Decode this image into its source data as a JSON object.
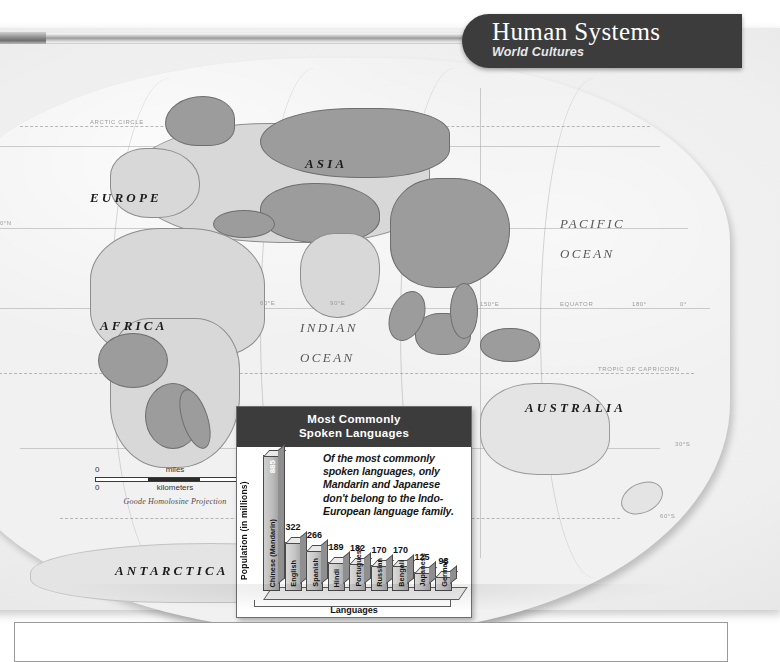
{
  "header": {
    "title": "Human Systems",
    "subtitle": "World Cultures"
  },
  "map": {
    "continents": [
      "EUROPE",
      "ASIA",
      "AFRICA",
      "AUSTRALIA",
      "ANTARCTICA"
    ],
    "oceans": [
      {
        "line1": "PACIFIC",
        "line2": "OCEAN"
      },
      {
        "line1": "INDIAN",
        "line2": "OCEAN"
      }
    ],
    "reference_lines": [
      "ARCTIC CIRCLE",
      "EQUATOR",
      "TROPIC OF CAPRICORN"
    ],
    "grid_labels": [
      "30°N",
      "60°E",
      "90°E",
      "150°E",
      "180°",
      "0°",
      "30°S",
      "60°S"
    ],
    "scale": {
      "miles_label": "miles",
      "miles_min": "0",
      "miles_max": "2000",
      "km_label": "kilometers",
      "km_min": "0",
      "km_max": "3000",
      "projection": "Goode Homolosine Projection"
    }
  },
  "chart_data": {
    "type": "bar",
    "title": "Most Commonly Spoken Languages",
    "title_line1": "Most Commonly",
    "title_line2": "Spoken Languages",
    "xlabel": "Languages",
    "ylabel": "Population (in millions)",
    "ylim": [
      0,
      885
    ],
    "grid": false,
    "legend": "none",
    "annotation": "Of the most commonly spoken languages, only Mandarin and Japanese don't belong to the Indo-European language family.",
    "categories": [
      "Chinese (Mandarin)",
      "English",
      "Spanish",
      "Hindi",
      "Portuguese",
      "Russian",
      "Bengali",
      "Japanese",
      "German"
    ],
    "values": [
      885,
      322,
      266,
      189,
      182,
      170,
      170,
      125,
      98
    ]
  },
  "colors": {
    "header_bg": "#3c3c3c",
    "header_text": "#ffffff",
    "map_land": "#d8d8d8",
    "map_land_dark": "#9c9c9c",
    "bar_fill": "#c6c6c6",
    "bar_stroke": "#4a4a4a"
  }
}
